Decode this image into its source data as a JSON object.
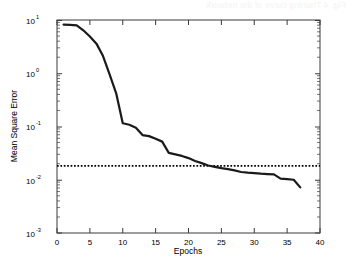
{
  "figure": {
    "background_color": "#ffffff",
    "bleed_through_text": "Fig. 4 Training curve of the network",
    "plot_frame": {
      "left_px": 57,
      "right_px": 320,
      "top_px": 20,
      "bottom_px": 233,
      "border_color": "#000000"
    }
  },
  "chart_data": {
    "type": "line",
    "title": "",
    "xlabel": "Epochs",
    "ylabel": "Mean Square Error",
    "xlim": [
      0,
      40
    ],
    "ylim": [
      0.001,
      10
    ],
    "yscale": "log",
    "xscale": "linear",
    "grid": false,
    "legend_position": "none",
    "xticks": [
      0,
      5,
      10,
      15,
      20,
      25,
      30,
      35,
      40
    ],
    "xticklabels": [
      "0",
      "5",
      "10",
      "15",
      "20",
      "25",
      "30",
      "35",
      "40"
    ],
    "yticks": [
      10,
      1,
      0.1,
      0.01,
      0.001
    ],
    "yticklabels": [
      "10",
      "10",
      "10",
      "10",
      "10"
    ],
    "ytick_exponents": [
      "1",
      "0",
      "-1",
      "-2",
      "-3"
    ],
    "minor_ticks": true,
    "series": [
      {
        "name": "Training error",
        "style": "solid",
        "color": "#1a1a1a",
        "line_width": 2.2,
        "x": [
          1,
          2,
          3,
          4,
          5,
          6,
          7,
          8,
          9,
          10,
          11,
          12,
          13,
          14,
          15,
          16,
          17,
          18,
          19,
          20,
          21,
          22,
          23,
          24,
          25,
          26,
          27,
          28,
          29,
          30,
          31,
          32,
          33,
          34,
          35,
          36,
          37
        ],
        "y": [
          8.2,
          8.1,
          7.9,
          6.4,
          4.9,
          3.6,
          2.1,
          0.95,
          0.42,
          0.115,
          0.108,
          0.095,
          0.069,
          0.066,
          0.059,
          0.052,
          0.032,
          0.03,
          0.028,
          0.0255,
          0.0225,
          0.0205,
          0.0185,
          0.0175,
          0.0165,
          0.0158,
          0.015,
          0.014,
          0.0136,
          0.0133,
          0.013,
          0.0128,
          0.0126,
          0.0105,
          0.0103,
          0.01,
          0.0072
        ]
      },
      {
        "name": "Goal",
        "style": "dotted",
        "color": "#000000",
        "line_width": 1.4,
        "constant_y": 0.0182,
        "x_span": [
          0,
          40
        ]
      }
    ],
    "annotations": []
  }
}
